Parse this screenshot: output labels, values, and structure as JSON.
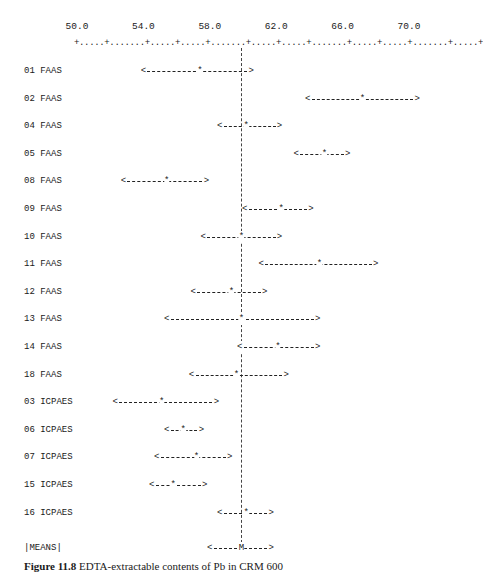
{
  "figure": {
    "caption_label": "Figure 11.8",
    "caption_text": "EDTA-extractable contents of Pb in CRM 600"
  },
  "axis": {
    "tick_labels": [
      "50.0",
      "54.0",
      "58.0",
      "62.0",
      "66.0",
      "70.0"
    ],
    "ruler": "+.....+.......+.....+.....+.......+.....+.....+.......+.....+.....+.......+.....+"
  },
  "means_label": "|MEANS|",
  "chart_data": {
    "type": "scatter",
    "subtype": "interval-plot",
    "title": "",
    "xlabel": "",
    "ylabel": "Laboratory / method",
    "xlim": [
      49.9,
      73.8
    ],
    "x_ticks": [
      50.0,
      54.0,
      58.0,
      62.0,
      66.0,
      70.0
    ],
    "grid": false,
    "legend": null,
    "reference_line": {
      "label": "mean of means",
      "x": 59.9
    },
    "series": [
      {
        "name": "01 FAAS",
        "low": 54.0,
        "mean": 57.4,
        "high": 60.5
      },
      {
        "name": "02 FAAS",
        "low": 63.9,
        "mean": 67.2,
        "high": 70.5
      },
      {
        "name": "04 FAAS",
        "low": 58.6,
        "mean": 60.2,
        "high": 62.2
      },
      {
        "name": "05 FAAS",
        "low": 63.2,
        "mean": 64.9,
        "high": 66.3
      },
      {
        "name": "08 FAAS",
        "low": 52.8,
        "mean": 55.4,
        "high": 57.8
      },
      {
        "name": "09 FAAS",
        "low": 60.1,
        "mean": 62.3,
        "high": 64.1
      },
      {
        "name": "10 FAAS",
        "low": 57.6,
        "mean": 59.9,
        "high": 62.2
      },
      {
        "name": "11 FAAS",
        "low": 61.1,
        "mean": 64.6,
        "high": 68.0
      },
      {
        "name": "12 FAAS",
        "low": 57.0,
        "mean": 59.3,
        "high": 61.3
      },
      {
        "name": "13 FAAS",
        "low": 55.4,
        "mean": 59.9,
        "high": 64.5
      },
      {
        "name": "14 FAAS",
        "low": 59.8,
        "mean": 62.1,
        "high": 64.5
      },
      {
        "name": "18 FAAS",
        "low": 56.9,
        "mean": 59.6,
        "high": 62.6
      },
      {
        "name": "03 ICPAES",
        "low": 52.3,
        "mean": 55.1,
        "high": 58.4
      },
      {
        "name": "06 ICPAES",
        "low": 55.4,
        "mean": 56.4,
        "high": 57.5
      },
      {
        "name": "07 ICPAES",
        "low": 54.8,
        "mean": 57.2,
        "high": 59.2
      },
      {
        "name": "15 ICPAES",
        "low": 54.5,
        "mean": 55.8,
        "high": 57.7
      },
      {
        "name": "16 ICPAES",
        "low": 58.6,
        "mean": 60.2,
        "high": 61.7
      }
    ],
    "means": {
      "name": "|MEANS|",
      "low": 58.0,
      "mean": 59.9,
      "high": 61.7,
      "marker": "M"
    }
  }
}
